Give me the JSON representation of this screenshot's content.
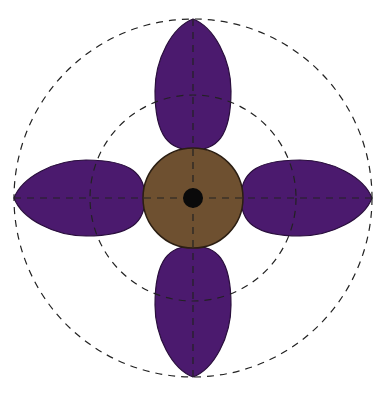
{
  "diagram": {
    "type": "flower-diagram",
    "center": {
      "x": 193,
      "y": 198
    },
    "colors": {
      "petal": "#4b1a6e",
      "petal_stroke": "#2a0f3d",
      "receptacle": "#6e5030",
      "receptacle_stroke": "#2b1e12",
      "center_dot": "#0a0a0a",
      "guide_line": "#222222"
    },
    "guide_circles": [
      {
        "name": "outer-guide-circle",
        "r": 179
      },
      {
        "name": "inner-guide-circle",
        "r": 103
      }
    ],
    "receptacle": {
      "r": 50
    },
    "center_dot": {
      "r": 10
    },
    "petals": [
      {
        "name": "petal-top",
        "angle": 0
      },
      {
        "name": "petal-right",
        "angle": 90
      },
      {
        "name": "petal-bottom",
        "angle": 180
      },
      {
        "name": "petal-left",
        "angle": 270
      }
    ],
    "petal_shape": {
      "base_offset": 50,
      "tip_offset": 179,
      "half_width": 38
    }
  }
}
